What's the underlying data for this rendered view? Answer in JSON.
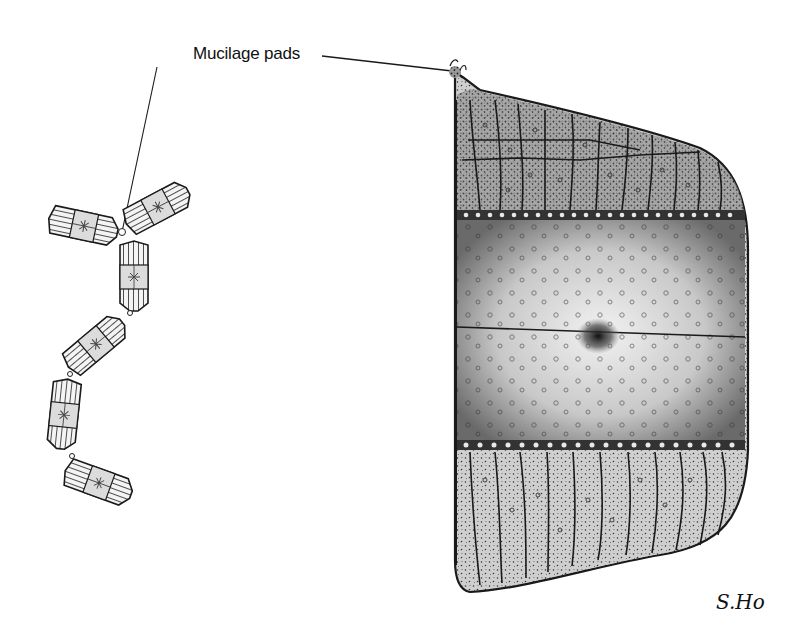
{
  "figure": {
    "annotation_label": "Mucilage pads",
    "signature": "S.Ho",
    "subjects": [
      {
        "name": "diatom-chain",
        "description": "Zig-zag chain of cells joined at corners by mucilage pads",
        "cell_count": 6
      },
      {
        "name": "single-cell-detail",
        "description": "Enlarged cell in girdle view showing areolate valve, banded girdle and central nodule"
      }
    ],
    "colors": {
      "ink": "#1a1a1a",
      "stipple_dark": "#3a3a3a",
      "stipple_light": "#d8d8d8",
      "background": "#ffffff"
    }
  }
}
